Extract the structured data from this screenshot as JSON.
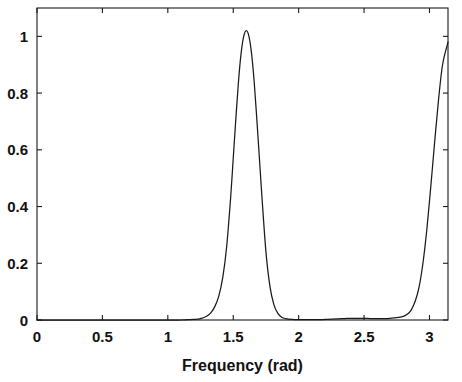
{
  "chart_data": {
    "type": "line",
    "title": "",
    "subtitle": "",
    "xlabel": "Frequency (rad)",
    "ylabel": "",
    "xlim": [
      0,
      3.14159
    ],
    "ylim": [
      0,
      1.1
    ],
    "xticks": [
      0,
      0.5,
      1,
      1.5,
      2,
      2.5,
      3
    ],
    "xtick_labels": [
      "0",
      "0.5",
      "1",
      "1.5",
      "2",
      "2.5",
      "3"
    ],
    "yticks": [
      0,
      0.2,
      0.4,
      0.6,
      0.8,
      1
    ],
    "ytick_labels": [
      "0",
      "0.2",
      "0.4",
      "0.6",
      "0.8",
      "1"
    ],
    "grid": false,
    "legend": null,
    "legend_position": "none",
    "line_color": "#1a1a1a",
    "background_color": "#ffffff",
    "annotations": [],
    "peaks": [
      {
        "center": 1.6,
        "height": 1.02,
        "fwhm": 0.2
      },
      {
        "center": 3.14159,
        "height": 0.98,
        "fwhm": 0.22
      }
    ],
    "series": [
      {
        "name": "spectrum",
        "x": [
          0.0,
          0.05,
          0.1,
          0.15,
          0.2,
          0.25,
          0.3,
          0.35,
          0.4,
          0.45,
          0.5,
          0.55,
          0.6,
          0.65,
          0.7,
          0.75,
          0.8,
          0.85,
          0.9,
          0.95,
          1.0,
          1.05,
          1.1,
          1.15,
          1.2,
          1.25,
          1.3,
          1.33,
          1.36,
          1.39,
          1.42,
          1.45,
          1.48,
          1.5,
          1.52,
          1.54,
          1.56,
          1.58,
          1.6,
          1.62,
          1.64,
          1.66,
          1.68,
          1.7,
          1.72,
          1.75,
          1.78,
          1.81,
          1.84,
          1.87,
          1.9,
          1.95,
          2.0,
          2.05,
          2.1,
          2.15,
          2.2,
          2.25,
          2.3,
          2.35,
          2.4,
          2.45,
          2.5,
          2.55,
          2.6,
          2.65,
          2.7,
          2.75,
          2.8,
          2.83,
          2.86,
          2.89,
          2.92,
          2.95,
          2.98,
          3.01,
          3.04,
          3.07,
          3.1,
          3.14159
        ],
        "y": [
          0.0,
          0.0,
          0.0,
          0.0,
          0.0,
          0.0,
          0.0,
          0.0,
          0.0,
          0.0,
          0.0,
          0.0,
          0.0,
          0.0,
          0.0,
          0.0,
          0.0,
          0.0,
          0.0,
          0.0,
          0.0,
          0.0,
          0.0,
          0.001,
          0.002,
          0.005,
          0.014,
          0.026,
          0.048,
          0.085,
          0.15,
          0.26,
          0.43,
          0.57,
          0.71,
          0.84,
          0.94,
          1.0,
          1.02,
          1.0,
          0.94,
          0.84,
          0.71,
          0.57,
          0.43,
          0.24,
          0.12,
          0.055,
          0.024,
          0.01,
          0.005,
          0.002,
          0.001,
          0.001,
          0.001,
          0.001,
          0.002,
          0.003,
          0.004,
          0.005,
          0.006,
          0.006,
          0.006,
          0.005,
          0.005,
          0.005,
          0.006,
          0.008,
          0.013,
          0.02,
          0.035,
          0.065,
          0.115,
          0.2,
          0.32,
          0.47,
          0.63,
          0.78,
          0.9,
          0.98
        ]
      }
    ]
  },
  "axes": {
    "x_axis_name": "frequency-axis",
    "y_axis_name": "amplitude-axis"
  }
}
